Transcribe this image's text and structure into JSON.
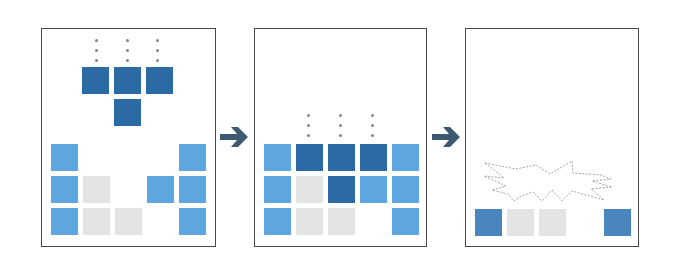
{
  "diagram": {
    "colors": {
      "falling_piece": "#2b6aa4",
      "settled_block": "#5ea6df",
      "cleared_row_block": "#4a86be",
      "empty_cell": "#e3e5e4",
      "arrow": "#3e5a72",
      "border": "#4a4a4a",
      "motion_dots": "#858585",
      "burst_outline": "#9a9a9a"
    },
    "grid": {
      "columns": 5,
      "rows": 3,
      "cell_size_px": 27,
      "pitch_px": 32
    },
    "panels": [
      {
        "step": 1,
        "label": "piece-falling",
        "falling_piece": {
          "shape": "T",
          "cells": [
            [
              0,
              1
            ],
            [
              0,
              2
            ],
            [
              0,
              3
            ],
            [
              1,
              2
            ]
          ]
        },
        "motion_dots_columns": [
          1,
          2,
          3
        ],
        "board": [
          [
            "light",
            "empty",
            "empty",
            "empty",
            "light"
          ],
          [
            "light",
            "gray",
            "empty",
            "light",
            "light"
          ],
          [
            "light",
            "gray",
            "gray",
            "empty",
            "light"
          ]
        ]
      },
      {
        "step": 2,
        "label": "piece-landed",
        "motion_dots_columns": [
          1,
          2,
          3
        ],
        "board": [
          [
            "light",
            "dark",
            "dark",
            "dark",
            "light"
          ],
          [
            "light",
            "gray",
            "dark",
            "light",
            "light"
          ],
          [
            "light",
            "gray",
            "gray",
            "empty",
            "light"
          ]
        ]
      },
      {
        "step": 3,
        "label": "rows-cleared",
        "burst": true,
        "board": [
          [
            "mid",
            "gray",
            "gray",
            "empty",
            "mid"
          ]
        ]
      }
    ],
    "arrows": [
      {
        "from": 1,
        "to": 2,
        "icon": "right-arrow-icon"
      },
      {
        "from": 2,
        "to": 3,
        "icon": "right-arrow-icon"
      }
    ]
  }
}
